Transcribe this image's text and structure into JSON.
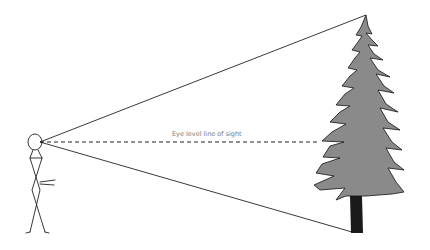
{
  "diagram": {
    "type": "sight-line illustration",
    "labels": {
      "eye_level": "Eye level line of sight"
    },
    "elements": {
      "observer": "stick-figure",
      "object": "pine-tree",
      "lines": [
        "line-to-tree-top",
        "eye-level-dashed-line",
        "line-to-tree-base"
      ]
    },
    "colors": {
      "line": "#222222",
      "tree_fill": "#8a8a8a",
      "tree_outline": "#111111",
      "trunk": "#1a1a1a",
      "label_text": "#777777"
    }
  }
}
